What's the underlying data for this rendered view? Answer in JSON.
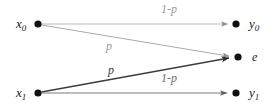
{
  "diagram": {
    "type": "channel-transition-diagram",
    "background_color": "#ffffff",
    "width": 278,
    "height": 110,
    "nodes": [
      {
        "id": "x0",
        "label": "x",
        "subscript": "0",
        "role": "input",
        "x": 38,
        "y": 24,
        "dot_radius": 3.6,
        "color": "#111111"
      },
      {
        "id": "x1",
        "label": "x",
        "subscript": "1",
        "role": "input",
        "x": 38,
        "y": 93,
        "dot_radius": 3.6,
        "color": "#111111"
      },
      {
        "id": "y0",
        "label": "y",
        "subscript": "0",
        "role": "output",
        "x": 236,
        "y": 24,
        "dot_radius": 3.6,
        "color": "#111111"
      },
      {
        "id": "e",
        "label": "e",
        "subscript": "",
        "role": "erasure",
        "x": 238,
        "y": 57,
        "dot_radius": 3.6,
        "color": "#111111"
      },
      {
        "id": "y1",
        "label": "y",
        "subscript": "1",
        "role": "output",
        "x": 236,
        "y": 93,
        "dot_radius": 3.6,
        "color": "#111111"
      }
    ],
    "edges": [
      {
        "id": "x0-y0",
        "from": "x0",
        "to": "y0",
        "label": "1-p",
        "label_x": 161,
        "label_y": 3,
        "color": "#b9b9b9",
        "width": 1.0,
        "tone": "faint"
      },
      {
        "id": "x0-e",
        "from": "x0",
        "to": "e",
        "label": "p",
        "label_x": 106,
        "label_y": 40,
        "color": "#aaaaaa",
        "width": 1.0,
        "tone": "faint"
      },
      {
        "id": "x1-e",
        "from": "x1",
        "to": "e",
        "label": "p",
        "label_x": 108,
        "label_y": 64,
        "color": "#3d3d3d",
        "width": 1.5,
        "tone": "dark"
      },
      {
        "id": "x1-y1",
        "from": "x1",
        "to": "y1",
        "label": "1-p",
        "label_x": 161,
        "label_y": 72,
        "color": "#7c7c7c",
        "width": 1.2,
        "tone": "mid"
      }
    ],
    "labels": {
      "x0": "x",
      "x0_sub": "0",
      "x1": "x",
      "x1_sub": "1",
      "y0": "y",
      "y0_sub": "0",
      "y1": "y",
      "y1_sub": "1",
      "e": "e",
      "prob_correct_top": "1-p",
      "prob_erase_upper": "p",
      "prob_erase_lower": "p",
      "prob_correct_bottom": "1-p"
    }
  }
}
